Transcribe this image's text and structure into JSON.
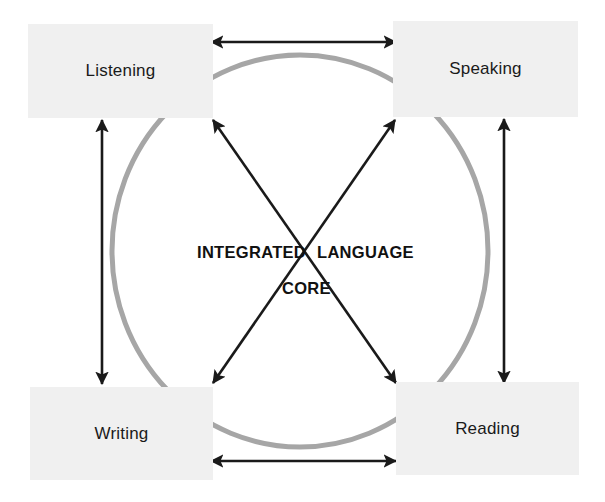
{
  "diagram": {
    "title": "Integrated Language Core",
    "center": {
      "line1_left": "INTEGRATED",
      "line1_right": "LANGUAGE",
      "line2": "CORE"
    },
    "colors": {
      "background": "#ffffff",
      "box_fill": "#f0f0f0",
      "circle_stroke": "#a6a6a6",
      "arrow_stroke": "#1a1a1a",
      "text": "#1a1a1a"
    },
    "skills": [
      {
        "id": "listening",
        "label": "Listening",
        "position": "top-left"
      },
      {
        "id": "speaking",
        "label": "Speaking",
        "position": "top-right"
      },
      {
        "id": "writing",
        "label": "Writing",
        "position": "bottom-left"
      },
      {
        "id": "reading",
        "label": "Reading",
        "position": "bottom-right"
      }
    ],
    "connections": [
      {
        "id": "top-horizontal",
        "from": "Listening",
        "to": "Speaking",
        "style": "double-arrow"
      },
      {
        "id": "bottom-horizontal",
        "from": "Writing",
        "to": "Reading",
        "style": "double-arrow"
      },
      {
        "id": "left-vertical",
        "from": "Listening",
        "to": "Writing",
        "style": "double-arrow"
      },
      {
        "id": "right-vertical",
        "from": "Speaking",
        "to": "Reading",
        "style": "double-arrow"
      },
      {
        "id": "diagonal-listening-reading",
        "from": "Listening",
        "to": "Reading",
        "style": "double-arrow"
      },
      {
        "id": "diagonal-speaking-writing",
        "from": "Speaking",
        "to": "Writing",
        "style": "double-arrow"
      }
    ],
    "circle": {
      "shape": "ellipse",
      "center_x": 300,
      "center_y": 251,
      "radius_x": 188,
      "radius_y": 196
    }
  }
}
